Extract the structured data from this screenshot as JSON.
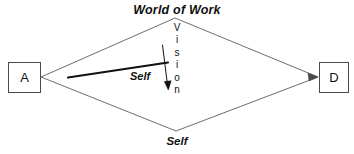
{
  "diagram": {
    "title_top": "World of Work",
    "label_bottom": "Self",
    "label_center": "Self",
    "vertical_label": "Vision",
    "vertical_label_letters": [
      "V",
      "i",
      "s",
      "i",
      "o",
      "n"
    ],
    "nodes": [
      {
        "id": "a",
        "label": "A"
      },
      {
        "id": "d",
        "label": "D"
      }
    ],
    "colors": {
      "background": "#ffffff",
      "diamond_stroke": "#6e6e6e",
      "box_stroke": "#4a4a4a",
      "text": "#111111",
      "thick_line": "#111111",
      "arrow": "#111111"
    },
    "geometry": {
      "diamond_left": [
        41,
        77
      ],
      "diamond_top": [
        175,
        18
      ],
      "diamond_right": [
        318,
        77
      ],
      "diamond_bottom": [
        176,
        131
      ],
      "thick_line_start": [
        68,
        77
      ],
      "thick_line_end": [
        168,
        63
      ],
      "vision_arrow_start": [
        163,
        45
      ],
      "vision_arrow_end": [
        168,
        88
      ]
    }
  }
}
